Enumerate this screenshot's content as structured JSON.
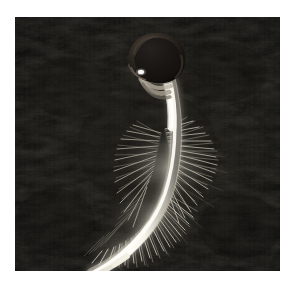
{
  "image": {
    "subject": "germinating-seed-radicle-with-root-hairs",
    "caption_visible": false,
    "alt": "Close-up photograph of a germinating seed with a long curved white radicle covered in fine root hairs against a dark soil background",
    "orientation": "portrait-square",
    "photo_frame": {
      "left": 15,
      "top": 17,
      "width": 265,
      "height": 254,
      "page_background_color": "#ffffff"
    },
    "colors": {
      "page_background": "#ffffff",
      "photo_background_dark": "#0a0a0a",
      "photo_background_mid": "#1a1916",
      "photo_background_highlight": "#2e2c26",
      "seed_coat_dark": "#15120f",
      "seed_coat_mid": "#3a332b",
      "seed_coat_light": "#5e5349",
      "root_white": "#fdfcf7",
      "root_shadow": "#b8b3a6",
      "root_hair": "#cfc9ba",
      "specular_highlight": "#ffffff"
    },
    "regions": [
      {
        "name": "seed-coat",
        "description": "dark brown seed coat at top, slightly tilted",
        "cx": 140,
        "cy": 48
      },
      {
        "name": "seed-coat-collar",
        "description": "pale torn seed coat collar wrapping the emerging stem",
        "cx": 146,
        "cy": 72
      },
      {
        "name": "hypocotyl",
        "description": "smooth bright white upper stem, no root hairs",
        "cx": 160,
        "cy": 95
      },
      {
        "name": "root-hair-zone",
        "description": "dense halo of fine white root hairs along the radicle",
        "cx": 160,
        "cy": 175
      },
      {
        "name": "radicle-tip",
        "description": "tapered smooth root tip curving to the lower left",
        "cx": 76,
        "cy": 258
      },
      {
        "name": "soil-background",
        "description": "near-black fibrous textured substrate",
        "cx": 60,
        "cy": 210
      }
    ]
  }
}
